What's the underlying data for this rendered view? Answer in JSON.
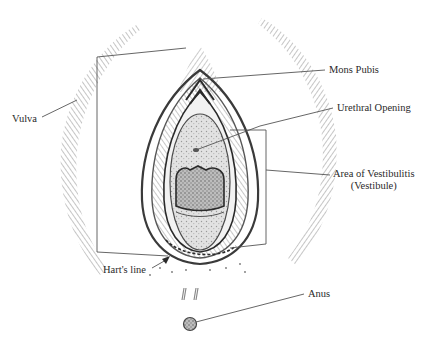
{
  "diagram": {
    "colors": {
      "ink": "#3a3a3a",
      "hatch": "#8a8a8a",
      "tissue": "#d9d9d9",
      "background": "#ffffff"
    },
    "labels": {
      "vulva": "Vulva",
      "mons_pubis": "Mons Pubis",
      "urethral_opening": "Urethral Opening",
      "vestibulitis_line1": "Area of Vestibulitis",
      "vestibulitis_line2": "(Vestibule)",
      "harts_line": "Hart's line",
      "anus": "Anus"
    }
  }
}
